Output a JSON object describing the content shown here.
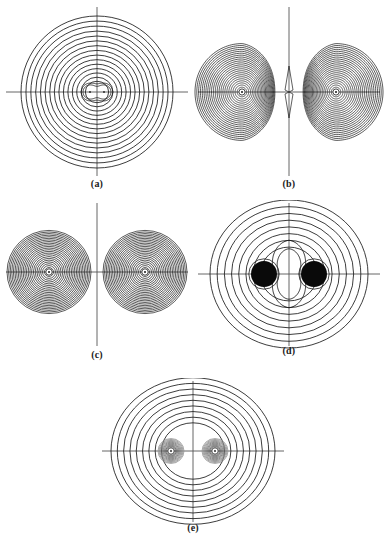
{
  "figure": {
    "type": "contour-plot-figure",
    "background_color": "#ffffff",
    "contour_color": "#1a1a1a",
    "axis_color": "#555555",
    "nucleus_marker_color": "#ffffff",
    "filled_blob_color": "#0a0a0a",
    "panels": [
      {
        "id": "a",
        "label": "(a)",
        "kind": "single-center-circular",
        "center": {
          "x": 95,
          "y": 88
        },
        "axes": {
          "horizontal_y": 88,
          "vertical_x": 95
        },
        "contour_count": 17,
        "outer_radius_x": 76,
        "outer_radius_y": 76,
        "inner_feature": "small-peanut",
        "nuclei": [
          {
            "x": 88,
            "y": 88
          },
          {
            "x": 102,
            "y": 88
          }
        ],
        "nucleus_separation": 14,
        "shading": "none"
      },
      {
        "id": "b",
        "label": "(b)",
        "kind": "two-lobes-touching-node",
        "center": {
          "x": 95,
          "y": 88
        },
        "axes": {
          "horizontal_y": 88,
          "vertical_x": 95
        },
        "contour_count": 24,
        "lobe_radius": 47,
        "lobe_offset": 47,
        "nuclei": [
          {
            "x": 48,
            "y": 88
          },
          {
            "x": 142,
            "y": 88
          }
        ],
        "nucleus_separation": 94,
        "shading": "dense-dark",
        "node_plane": "vertical-midline-cusp"
      },
      {
        "id": "c",
        "label": "(c)",
        "kind": "two-separated-spheres",
        "center": {
          "x": 95,
          "y": 72
        },
        "axes": {
          "horizontal_y": 72,
          "vertical_x": 95
        },
        "contour_count": 24,
        "lobe_radius": 42,
        "lobe_offset": 48,
        "nuclei": [
          {
            "x": 47,
            "y": 72
          },
          {
            "x": 143,
            "y": 72
          }
        ],
        "nucleus_separation": 96,
        "shading": "dense-dark"
      },
      {
        "id": "d",
        "label": "(d)",
        "kind": "outer-circles-with-hourglass-core",
        "center": {
          "x": 95,
          "y": 74
        },
        "axes": {
          "horizontal_y": 74,
          "vertical_x": 95
        },
        "contour_count": 11,
        "outer_radius_x": 79,
        "outer_radius_y": 74,
        "inner_feature": "hourglass-vase",
        "nuclei": [
          {
            "x": 70,
            "y": 74
          },
          {
            "x": 120,
            "y": 74
          }
        ],
        "nucleus_separation": 50,
        "shading": "solid-black-blobs",
        "blob_radius": 13
      },
      {
        "id": "e",
        "label": "(e)",
        "kind": "outer-circles-with-peanut-core",
        "center": {
          "x": 95,
          "y": 73
        },
        "axes": {
          "horizontal_y": 73,
          "vertical_x": 95
        },
        "contour_count": 13,
        "outer_radius_x": 82,
        "outer_radius_y": 74,
        "inner_feature": "peanut-with-dense-cores",
        "nuclei": [
          {
            "x": 73,
            "y": 73
          },
          {
            "x": 117,
            "y": 73
          }
        ],
        "nucleus_separation": 44,
        "shading": "gray-dense-cores"
      }
    ]
  }
}
